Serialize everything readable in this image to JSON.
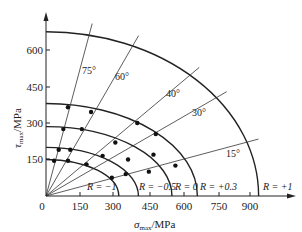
{
  "diagram": {
    "type": "polar-stress-envelope",
    "x_axis": {
      "label_symbol": "σ",
      "label_sub": "max",
      "label_unit": "/MPa",
      "ticks": [
        "0",
        "150",
        "300",
        "450",
        "600",
        "750",
        "900"
      ]
    },
    "y_axis": {
      "label_symbol": "τ",
      "label_sub": "max",
      "label_unit": "/MPa",
      "ticks": [
        "150",
        "300",
        "450",
        "600"
      ]
    },
    "angle_lines": [
      {
        "angle": 75,
        "label": "75°"
      },
      {
        "angle": 60,
        "label": "60°"
      },
      {
        "angle": 40,
        "label": "40°"
      },
      {
        "angle": 30,
        "label": "30°"
      },
      {
        "angle": 15,
        "label": "15°"
      }
    ],
    "curves": [
      {
        "label": "R = −1",
        "sigma_intercept": 315,
        "tau_intercept": 150
      },
      {
        "label": "",
        "sigma_intercept": 400,
        "tau_intercept": 200
      },
      {
        "label": "R = −0.5",
        "sigma_intercept": 545,
        "tau_intercept": 285
      },
      {
        "label": "R = 0",
        "sigma_intercept": 655,
        "tau_intercept": 380
      },
      {
        "label": "R = +0.3",
        "sigma_intercept": 655,
        "tau_intercept": 380
      },
      {
        "label": "R = +1",
        "sigma_intercept": 920,
        "tau_intercept": 675
      }
    ],
    "curve_labels": [
      "R = −1",
      "R = −0.5",
      "R = 0",
      "R = +0.3",
      "R = +1"
    ]
  },
  "chart_data": {
    "type": "scatter",
    "title": "",
    "xlabel": "σmax/MPa",
    "ylabel": "τmax/MPa",
    "xlim": [
      0,
      1000
    ],
    "ylim": [
      0,
      720
    ],
    "x_ticks": [
      0,
      150,
      300,
      450,
      600,
      750,
      900
    ],
    "y_ticks": [
      150,
      300,
      450,
      600
    ],
    "radial_lines_deg": [
      75,
      60,
      40,
      30,
      15
    ],
    "envelopes": [
      {
        "name": "R = −1",
        "sigma_at_0deg": 315,
        "tau_at_90deg": 150
      },
      {
        "name": "R = −0.5 (inner)",
        "sigma_at_0deg": 400,
        "tau_at_90deg": 200
      },
      {
        "name": "R = −0.5",
        "sigma_at_0deg": 545,
        "tau_at_90deg": 285
      },
      {
        "name": "R = 0",
        "sigma_at_0deg": 655,
        "tau_at_90deg": 380
      },
      {
        "name": "R = +1",
        "sigma_at_0deg": 920,
        "tau_at_90deg": 675
      }
    ],
    "points": [
      {
        "x": 95,
        "y": 365
      },
      {
        "x": 195,
        "y": 345
      },
      {
        "x": 395,
        "y": 300
      },
      {
        "x": 475,
        "y": 255
      },
      {
        "x": 75,
        "y": 275
      },
      {
        "x": 155,
        "y": 275
      },
      {
        "x": 300,
        "y": 220
      },
      {
        "x": 465,
        "y": 170
      },
      {
        "x": 560,
        "y": 125
      },
      {
        "x": 55,
        "y": 190
      },
      {
        "x": 105,
        "y": 190
      },
      {
        "x": 245,
        "y": 165
      },
      {
        "x": 355,
        "y": 150
      },
      {
        "x": 445,
        "y": 100
      },
      {
        "x": 35,
        "y": 145
      },
      {
        "x": 95,
        "y": 145
      },
      {
        "x": 175,
        "y": 130
      },
      {
        "x": 285,
        "y": 75
      },
      {
        "x": 345,
        "y": 90
      }
    ],
    "legend": []
  }
}
